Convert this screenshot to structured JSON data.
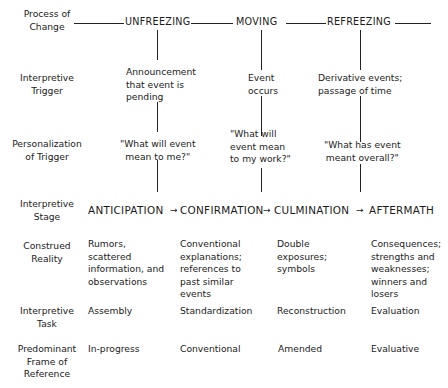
{
  "row_labels": [
    "Process of\nChange",
    "Interpretive\nTrigger",
    "Personalization\nof Trigger",
    "Interpretive\nStage",
    "Construed\nReality",
    "Interpretive\nTask",
    "Predominant\nFrame of\nReference"
  ],
  "process": [
    "UNFREEZING",
    "MOVING",
    "REFREEZING"
  ],
  "triggers": [
    "Announcement\nthat event is\npending",
    "Event\noccurs",
    "Derivative events;\npassage of time"
  ],
  "personalization": [
    "\"What will event\nmean to me?\"",
    "\"What will\nevent mean\nto my work?\"",
    "\"What has event\nmeant overall?\""
  ],
  "stages": [
    "ANTICIPATION",
    "CONFIRMATION",
    "CULMINATION",
    "AFTERMATH"
  ],
  "stage_arrow": "→",
  "construed_reality": [
    "Rumors,\nscattered\ninformation, and\nobservations",
    "Conventional\nexplanations;\nreferences to\npast similar\nevents",
    "Double\nexposures;\nsymbols",
    "Consequences;\nstrengths and\nweaknesses;\nwinners and\nlosers"
  ],
  "tasks": [
    "Assembly",
    "Standardization",
    "Reconstruction",
    "Evaluation"
  ],
  "frames": [
    "In-progress",
    "Conventional",
    "Amended",
    "Evaluative"
  ]
}
